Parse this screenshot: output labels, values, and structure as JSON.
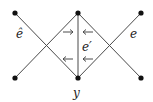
{
  "diagram": {
    "title": "",
    "nodes": [
      {
        "id": "tl",
        "x": 15,
        "y": 13
      },
      {
        "id": "tm",
        "x": 78,
        "y": 13
      },
      {
        "id": "tr",
        "x": 141,
        "y": 13
      },
      {
        "id": "bl",
        "x": 15,
        "y": 78
      },
      {
        "id": "bm",
        "x": 78,
        "y": 78
      },
      {
        "id": "br",
        "x": 141,
        "y": 78
      }
    ],
    "edges": [
      {
        "from": "tl",
        "to": "bm"
      },
      {
        "from": "bl",
        "to": "tm"
      },
      {
        "from": "tm",
        "to": "br"
      },
      {
        "from": "bm",
        "to": "tr"
      },
      {
        "from": "tm",
        "to": "bm"
      }
    ],
    "arrows": [
      {
        "position": "upper-left",
        "direction": "right"
      },
      {
        "position": "upper-right",
        "direction": "left"
      },
      {
        "position": "lower-left",
        "direction": "left"
      },
      {
        "position": "lower-right",
        "direction": "left"
      }
    ],
    "labels": {
      "e_hat": "ê",
      "e": "e",
      "e_prime": "e′",
      "y": "y"
    },
    "colors": {
      "edge": "#4a4a4a",
      "node": "#111111",
      "text": "#222222"
    }
  }
}
